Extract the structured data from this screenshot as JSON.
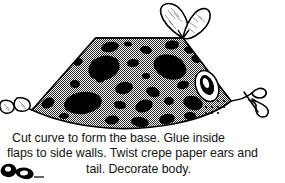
{
  "page": {
    "width": 285,
    "height": 183,
    "background_color": "#ffffff",
    "ink_color": "#000000"
  },
  "caption": {
    "line_1": "Cut curve to form the base. Glue inside",
    "line_2": "flaps to side walls. Twist crepe paper ears and",
    "line_3": "tail. Decorate body.",
    "full_text": "Cut curve to form the base. Glue inside flaps to side walls. Twist crepe paper ears and tail. Decorate body.",
    "text_color": "#141414"
  },
  "illustration": {
    "title": "spotted-animal-body-craft-diagram",
    "description": "Line drawing of a trapezoidal paper body with a curved base, halftone gray fill, large black spots, crepe paper ears at top, an eye with whisker dots at right, a curly twisted tail at right, and small tab flaps at left.",
    "body": {
      "name": "animal-body-trapezoid",
      "fill_pattern": "halftone-checker-gray",
      "fill_color": "#b4b4b4",
      "outline_color": "#000000",
      "top_edge_label": "straight top edge",
      "bottom_edge_label": "cut curve to form the base"
    },
    "ears": {
      "name": "crepe-paper-ears",
      "count": 2,
      "style": "leaf-shaped with hatching lines, pinched at base",
      "fill_color": "#ffffff"
    },
    "tail": {
      "name": "crepe-paper-tail",
      "style": "curly twisted loop",
      "fill_color": "#ffffff"
    },
    "eye": {
      "name": "animal-eye",
      "style": "oval with thick black ring and white highlight"
    },
    "whisker_dots": {
      "name": "whisker-dot-grid",
      "rows": 3,
      "columns": 4
    },
    "flaps": {
      "name": "side-wall-flaps",
      "count": 2,
      "style": "small outlined tabs at left edge"
    },
    "spots": {
      "name": "decorative-black-spots",
      "count": 28,
      "color": "#000000"
    }
  }
}
